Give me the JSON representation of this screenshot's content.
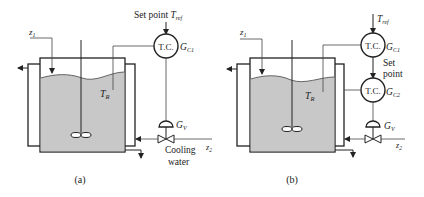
{
  "figure": {
    "panels": [
      {
        "id": "a",
        "caption": "(a)",
        "feed_label": "z",
        "feed_sub": "1",
        "reactor_temp_label": "T",
        "reactor_temp_sub": "R",
        "setpoint_text": "Set point ",
        "setpoint_var": "T",
        "setpoint_sub": "ref",
        "controllers": [
          {
            "text": "T.C.",
            "gain": "G",
            "gain_sub": "C1"
          }
        ],
        "valve_gain": "G",
        "valve_gain_sub": "V",
        "disturbance": "z",
        "disturbance_sub": "2",
        "coolant_line1": "Cooling",
        "coolant_line2": "water"
      },
      {
        "id": "b",
        "caption": "(b)",
        "feed_label": "z",
        "feed_sub": "1",
        "reactor_temp_label": "T",
        "reactor_temp_sub": "R",
        "setpoint_var": "T",
        "setpoint_sub": "ref",
        "inner_setpoint_line1": "Set",
        "inner_setpoint_line2": "point",
        "controllers": [
          {
            "text": "T.C.",
            "gain": "G",
            "gain_sub": "C1"
          },
          {
            "text": "T.C.",
            "gain": "G",
            "gain_sub": "C2"
          }
        ],
        "valve_gain": "G",
        "valve_gain_sub": "V",
        "disturbance": "z",
        "disturbance_sub": "2"
      }
    ],
    "colors": {
      "line": "#222222",
      "liquid": "#c8c8c8",
      "background": "#ffffff"
    }
  }
}
